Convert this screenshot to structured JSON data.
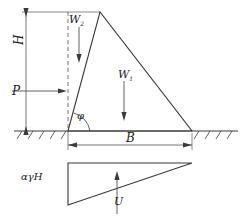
{
  "figure": {
    "labels": {
      "height": "H",
      "base": "B",
      "water_thrust": "P",
      "weight_main": "W",
      "weight_main_sub": "1",
      "weight_upper": "W",
      "weight_upper_sub": "2",
      "friction_angle": "φ",
      "uplift_intensity": "αγH",
      "uplift_resultant": "U"
    },
    "colors": {
      "line": "#3a3a3a",
      "background": "#ffffff",
      "text": "#1a1a1a"
    }
  },
  "geometry": {
    "ground_line_y": 131,
    "crest_x": 100,
    "crest_y": 12,
    "heel_x": 68,
    "toe_x": 192,
    "dimension_H_x": 26,
    "base_dim_y": 145,
    "uplift_top_y": 163,
    "uplift_bottom_y": 205
  }
}
